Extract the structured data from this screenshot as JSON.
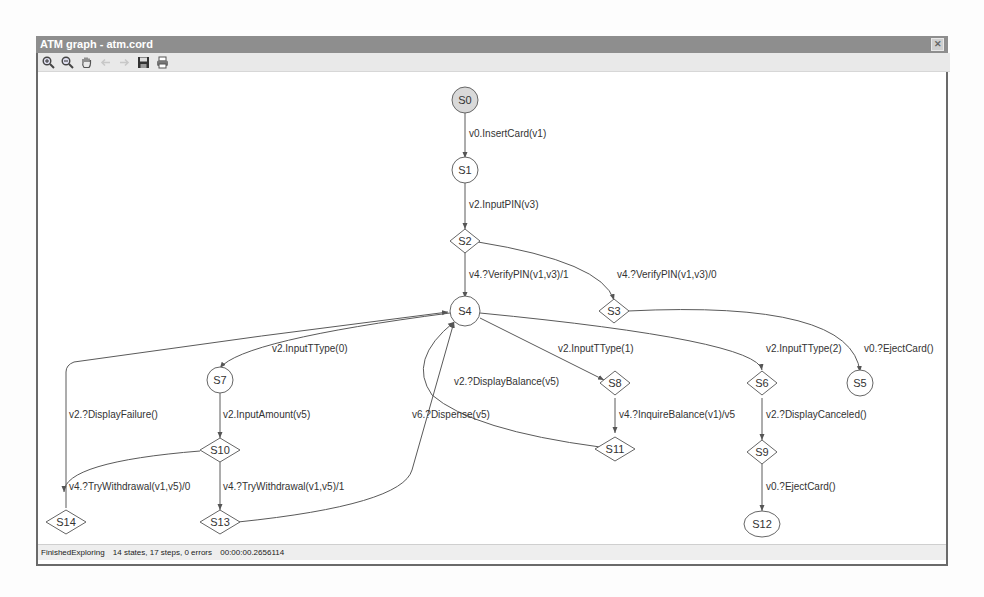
{
  "window": {
    "title": "ATM graph - atm.cord",
    "close_label": "✕"
  },
  "toolbar": {
    "buttons": [
      {
        "name": "zoom-in",
        "icon": "zoom-in-icon"
      },
      {
        "name": "zoom-out",
        "icon": "zoom-out-icon"
      },
      {
        "name": "pan",
        "icon": "hand-icon"
      },
      {
        "name": "back",
        "icon": "arrow-left-icon"
      },
      {
        "name": "forward",
        "icon": "arrow-right-icon"
      },
      {
        "name": "save",
        "icon": "floppy-disk-icon"
      },
      {
        "name": "print",
        "icon": "printer-icon"
      }
    ]
  },
  "graph": {
    "nodes": [
      {
        "id": "S0",
        "label": "S0",
        "shape": "circle",
        "initial": true
      },
      {
        "id": "S1",
        "label": "S1",
        "shape": "circle"
      },
      {
        "id": "S2",
        "label": "S2",
        "shape": "diamond"
      },
      {
        "id": "S3",
        "label": "S3",
        "shape": "diamond"
      },
      {
        "id": "S4",
        "label": "S4",
        "shape": "circle"
      },
      {
        "id": "S5",
        "label": "S5",
        "shape": "circle"
      },
      {
        "id": "S6",
        "label": "S6",
        "shape": "diamond"
      },
      {
        "id": "S7",
        "label": "S7",
        "shape": "circle"
      },
      {
        "id": "S8",
        "label": "S8",
        "shape": "diamond"
      },
      {
        "id": "S9",
        "label": "S9",
        "shape": "diamond"
      },
      {
        "id": "S10",
        "label": "S10",
        "shape": "diamond"
      },
      {
        "id": "S11",
        "label": "S11",
        "shape": "diamond"
      },
      {
        "id": "S12",
        "label": "S12",
        "shape": "ellipse"
      },
      {
        "id": "S13",
        "label": "S13",
        "shape": "diamond"
      },
      {
        "id": "S14",
        "label": "S14",
        "shape": "diamond"
      }
    ],
    "edges": [
      {
        "from": "S0",
        "to": "S1",
        "label": "v0.InsertCard(v1)"
      },
      {
        "from": "S1",
        "to": "S2",
        "label": "v2.InputPIN(v3)"
      },
      {
        "from": "S2",
        "to": "S4",
        "label": "v4.?VerifyPIN(v1,v3)/1"
      },
      {
        "from": "S2",
        "to": "S3",
        "label": "v4.?VerifyPIN(v1,v3)/0"
      },
      {
        "from": "S3",
        "to": "S5",
        "label": "v0.?EjectCard()"
      },
      {
        "from": "S4",
        "to": "S7",
        "label": "v2.InputTType(0)"
      },
      {
        "from": "S4",
        "to": "S8",
        "label": "v2.InputTType(1)"
      },
      {
        "from": "S4",
        "to": "S6",
        "label": "v2.InputTType(2)"
      },
      {
        "from": "S7",
        "to": "S10",
        "label": "v2.InputAmount(v5)"
      },
      {
        "from": "S10",
        "to": "S14",
        "label": "v4.?TryWithdrawal(v1,v5)/0"
      },
      {
        "from": "S10",
        "to": "S13",
        "label": "v4.?TryWithdrawal(v1,v5)/1"
      },
      {
        "from": "S14",
        "to": "S4",
        "label": "v2.?DisplayFailure()"
      },
      {
        "from": "S13",
        "to": "S4",
        "label": "v6.?Dispense(v5)"
      },
      {
        "from": "S8",
        "to": "S11",
        "label": "v4.?InquireBalance(v1)/v5"
      },
      {
        "from": "S11",
        "to": "S4",
        "label": "v2.?DisplayBalance(v5)"
      },
      {
        "from": "S6",
        "to": "S9",
        "label": "v2.?DisplayCanceled()"
      },
      {
        "from": "S9",
        "to": "S12",
        "label": "v0.?EjectCard()"
      }
    ]
  },
  "status": {
    "state": "FinishedExploring",
    "summary": "14 states, 17 steps, 0 errors",
    "elapsed": "00:00:00.2656114"
  },
  "colors": {
    "titlebar": "#8e8e8e",
    "initial_node_fill": "#d9d9d9",
    "edge": "#555555"
  }
}
